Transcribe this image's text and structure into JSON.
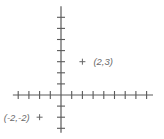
{
  "chart_data": {
    "type": "scatter",
    "title": "",
    "xlabel": "",
    "ylabel": "",
    "grid": false,
    "axes": {
      "x_range": [
        -4.5,
        8.6
      ],
      "y_range": [
        -3.4,
        8.0
      ],
      "x_ticks": [
        -4,
        -3,
        -2,
        -1,
        1,
        2,
        3,
        4,
        5,
        6,
        7,
        8
      ],
      "y_ticks": [
        -3,
        -2,
        -1,
        1,
        2,
        3,
        4,
        5,
        6,
        7
      ],
      "tick_labels_shown": false
    },
    "points": [
      {
        "x": 2,
        "y": 3,
        "label": "(2,3)",
        "marker": "+",
        "label_side": "right"
      },
      {
        "x": -2,
        "y": -2,
        "label": "(-2,-2)",
        "marker": "+",
        "label_side": "left"
      }
    ]
  },
  "colors": {
    "axis": "#5a5a5a",
    "label": "#6a6a6a"
  }
}
